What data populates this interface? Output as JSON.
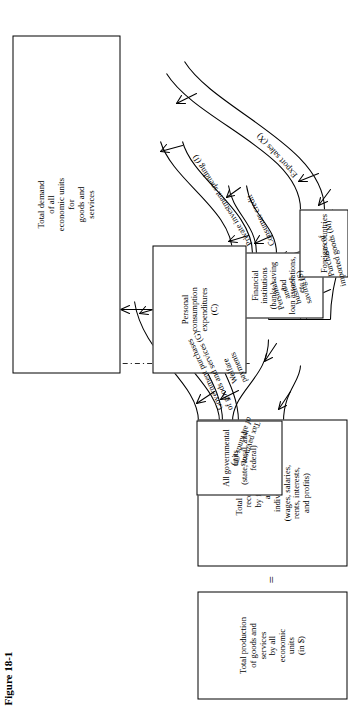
{
  "figure": {
    "caption": "Figure 18-1",
    "equals_sign": "="
  },
  "boxes": {
    "total_production": "Total production\nof goods and\nservices\nby all\neconomic\nunits\n(in $)",
    "total_income": "Total income\nreceived\nby firms\nand\nindividuals\n(wages, salaries,\nrents, interests,\nand profits)",
    "government": "All governmental\nunits\n(state, local, and\nfederal)",
    "financial": "Financial\ninstitutions\n(banks, saving and\nloan associations,\netc.)",
    "foreign": "Foreign countries",
    "personal_consumption": "Personal\nconsumption\nexpenditures\n(C)",
    "total_demand": "Total demand\nof all\neconomic units\nfor\ngoods and\nservices"
  },
  "flows": {
    "tax_payments": "Tax payments\nof all kinds (T)",
    "government_purchases": "Government purchases\nof goods and services (G)",
    "welfare_payments": "Welfare\npayments",
    "personal_business_saving": "Personal\nand\nbusiness\nsaving (S)",
    "consumer_credit": "Consumer credit",
    "private_investment": "Private investment spending (I)",
    "purchases_imported": "Purchases of\nimported goods (M)",
    "export_sales": "Export sales (X)"
  }
}
